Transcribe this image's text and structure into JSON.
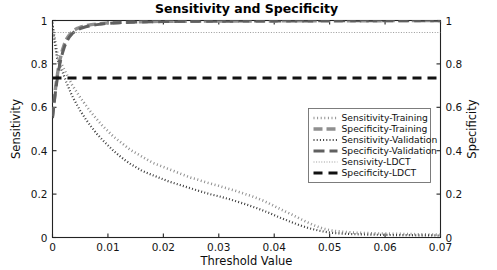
{
  "chart_data": {
    "type": "line",
    "title": "Sensitivity and Specificity",
    "xlabel": "Threshold Value",
    "ylabel": "Sensitivity",
    "y2label": "Specificity",
    "xlim": [
      0,
      0.07
    ],
    "ylim": [
      0,
      1
    ],
    "y2lim": [
      0,
      1
    ],
    "xticks": [
      0,
      0.01,
      0.02,
      0.03,
      0.04,
      0.05,
      0.06,
      0.07
    ],
    "xticklabels": [
      "0",
      "0.01",
      "0.02",
      "0.03",
      "0.04",
      "0.05",
      "0.06",
      "0.07"
    ],
    "yticks": [
      0,
      0.2,
      0.4,
      0.6,
      0.8,
      1
    ],
    "yticklabels": [
      "0",
      "0.2",
      "0.4",
      "0.6",
      "0.8",
      "1"
    ],
    "y2ticks": [
      0,
      0.2,
      0.4,
      0.6,
      0.8,
      1
    ],
    "y2ticklabels": [
      "0",
      "0.2",
      "0.4",
      "0.6",
      "0.8",
      "1"
    ],
    "grid": false,
    "legend_position": "center-right",
    "series": [
      {
        "name": "Sensitivity-Training",
        "axis": "left",
        "color": "#8f8f8f",
        "width": 2.6,
        "dash": "1,2.6",
        "x": [
          0,
          0.0004,
          0.0008,
          0.0012,
          0.0016,
          0.002,
          0.0025,
          0.003,
          0.0035,
          0.004,
          0.005,
          0.006,
          0.007,
          0.008,
          0.009,
          0.01,
          0.011,
          0.012,
          0.013,
          0.014,
          0.015,
          0.016,
          0.017,
          0.018,
          0.019,
          0.02,
          0.021,
          0.022,
          0.023,
          0.024,
          0.025,
          0.026,
          0.027,
          0.028,
          0.029,
          0.03,
          0.031,
          0.032,
          0.033,
          0.034,
          0.035,
          0.036,
          0.037,
          0.038,
          0.039,
          0.04,
          0.041,
          0.042,
          0.043,
          0.044,
          0.045,
          0.046,
          0.047,
          0.048,
          0.049,
          0.05,
          0.051,
          0.052,
          0.054,
          0.056,
          0.058,
          0.06,
          0.062,
          0.064,
          0.066,
          0.068,
          0.07
        ],
        "y": [
          0.97,
          0.92,
          0.86,
          0.815,
          0.8,
          0.78,
          0.755,
          0.73,
          0.705,
          0.685,
          0.645,
          0.61,
          0.575,
          0.545,
          0.515,
          0.49,
          0.465,
          0.445,
          0.425,
          0.405,
          0.39,
          0.375,
          0.36,
          0.345,
          0.335,
          0.325,
          0.315,
          0.305,
          0.295,
          0.285,
          0.275,
          0.268,
          0.26,
          0.252,
          0.245,
          0.238,
          0.23,
          0.223,
          0.215,
          0.207,
          0.198,
          0.19,
          0.18,
          0.17,
          0.158,
          0.145,
          0.132,
          0.12,
          0.108,
          0.095,
          0.082,
          0.07,
          0.058,
          0.048,
          0.04,
          0.034,
          0.03,
          0.027,
          0.023,
          0.021,
          0.019,
          0.018,
          0.017,
          0.016,
          0.015,
          0.014,
          0.013
        ]
      },
      {
        "name": "Specificity-Training",
        "axis": "right",
        "color": "#8f8f8f",
        "width": 3.4,
        "dash": "9,4",
        "x": [
          0,
          0.0003,
          0.0006,
          0.001,
          0.0014,
          0.0018,
          0.0022,
          0.0026,
          0.003,
          0.0035,
          0.004,
          0.0045,
          0.005,
          0.006,
          0.007,
          0.008,
          0.009,
          0.01,
          0.012,
          0.014,
          0.016,
          0.018,
          0.02,
          0.024,
          0.028,
          0.032,
          0.036,
          0.04,
          0.045,
          0.05,
          0.055,
          0.06,
          0.065,
          0.07
        ],
        "y": [
          0.56,
          0.63,
          0.7,
          0.77,
          0.825,
          0.865,
          0.895,
          0.917,
          0.932,
          0.947,
          0.957,
          0.964,
          0.969,
          0.976,
          0.981,
          0.984,
          0.987,
          0.989,
          0.991,
          0.993,
          0.994,
          0.995,
          0.996,
          0.9965,
          0.997,
          0.9975,
          0.998,
          0.998,
          0.9985,
          0.999,
          0.999,
          0.9992,
          0.9994,
          0.9995
        ]
      },
      {
        "name": "Sensitivity-Validation",
        "axis": "left",
        "color": "#3c3c3c",
        "width": 2.2,
        "dash": "1,2.2",
        "x": [
          0,
          0.0004,
          0.0008,
          0.0012,
          0.0016,
          0.002,
          0.0025,
          0.003,
          0.0035,
          0.004,
          0.005,
          0.006,
          0.007,
          0.008,
          0.009,
          0.01,
          0.011,
          0.012,
          0.013,
          0.014,
          0.015,
          0.016,
          0.017,
          0.018,
          0.019,
          0.02,
          0.021,
          0.022,
          0.023,
          0.024,
          0.025,
          0.026,
          0.027,
          0.028,
          0.029,
          0.03,
          0.031,
          0.032,
          0.033,
          0.034,
          0.035,
          0.036,
          0.037,
          0.038,
          0.039,
          0.04,
          0.041,
          0.042,
          0.043,
          0.044,
          0.045,
          0.046,
          0.047,
          0.048,
          0.049,
          0.05,
          0.051,
          0.052,
          0.054,
          0.056,
          0.058,
          0.06,
          0.062,
          0.064,
          0.066,
          0.068,
          0.07
        ],
        "y": [
          0.99,
          0.9,
          0.83,
          0.8,
          0.775,
          0.75,
          0.715,
          0.685,
          0.655,
          0.63,
          0.585,
          0.545,
          0.51,
          0.478,
          0.45,
          0.425,
          0.4,
          0.378,
          0.358,
          0.34,
          0.325,
          0.31,
          0.298,
          0.288,
          0.278,
          0.268,
          0.258,
          0.25,
          0.242,
          0.234,
          0.226,
          0.218,
          0.21,
          0.203,
          0.196,
          0.19,
          0.183,
          0.176,
          0.168,
          0.16,
          0.152,
          0.143,
          0.134,
          0.124,
          0.114,
          0.103,
          0.092,
          0.082,
          0.072,
          0.062,
          0.053,
          0.045,
          0.038,
          0.032,
          0.027,
          0.023,
          0.02,
          0.018,
          0.016,
          0.014,
          0.013,
          0.012,
          0.011,
          0.011,
          0.01,
          0.01,
          0.009
        ]
      },
      {
        "name": "Specificity-Validation",
        "axis": "right",
        "color": "#606060",
        "width": 3.0,
        "dash": "11,5",
        "x": [
          0,
          0.0003,
          0.0006,
          0.001,
          0.0014,
          0.0018,
          0.0022,
          0.0026,
          0.003,
          0.0035,
          0.004,
          0.0045,
          0.005,
          0.006,
          0.007,
          0.008,
          0.009,
          0.01,
          0.012,
          0.014,
          0.016,
          0.018,
          0.02,
          0.024,
          0.028,
          0.032,
          0.036,
          0.04,
          0.045,
          0.05,
          0.055,
          0.06,
          0.065,
          0.07
        ],
        "y": [
          0.55,
          0.62,
          0.685,
          0.755,
          0.81,
          0.85,
          0.882,
          0.905,
          0.922,
          0.938,
          0.949,
          0.957,
          0.963,
          0.971,
          0.977,
          0.981,
          0.984,
          0.987,
          0.99,
          0.992,
          0.993,
          0.994,
          0.995,
          0.996,
          0.9965,
          0.997,
          0.9975,
          0.998,
          0.998,
          0.9985,
          0.999,
          0.999,
          0.9992,
          0.9993
        ]
      },
      {
        "name": "Sensivity-LDCT",
        "axis": "left",
        "color": "#9a9a9a",
        "width": 1.1,
        "dash": "1,1.6",
        "constant": 0.945,
        "x": [
          0,
          0.07
        ],
        "y": [
          0.945,
          0.945
        ]
      },
      {
        "name": "Specificity-LDCT",
        "axis": "right",
        "color": "#111111",
        "width": 3.2,
        "dash": "9,6",
        "constant": 0.735,
        "x": [
          0,
          0.07
        ],
        "y": [
          0.735,
          0.735
        ]
      }
    ]
  },
  "legend": {
    "entries": [
      {
        "label": "Sensitivity-Training"
      },
      {
        "label": "Specificity-Training"
      },
      {
        "label": "Sensitivity-Validation"
      },
      {
        "label": "Specificity-Validation"
      },
      {
        "label": "Sensivity-LDCT"
      },
      {
        "label": "Specificity-LDCT"
      }
    ]
  },
  "colors": {
    "axis": "#232323",
    "background": "#ffffff",
    "legend_border": "#6f6f6f"
  }
}
